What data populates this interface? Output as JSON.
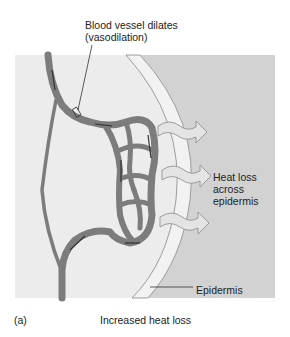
{
  "figure": {
    "panel_label": "(a)",
    "caption": "Increased heat loss",
    "labels": {
      "vessel_line1": "Blood vessel dilates",
      "vessel_line2": "(vasodilation)",
      "heat_line1": "Heat loss",
      "heat_line2": "across",
      "heat_line3": "epidermis",
      "epidermis": "Epidermis"
    },
    "colors": {
      "dermis_bg": "#ececec",
      "outside_bg": "#d2d2d2",
      "epidermis_band": "#efefef",
      "vessel": "#7c7c7c",
      "vessel_arrow": "#333333",
      "heat_arrow_fill": "#e2e2e2",
      "heat_arrow_stroke": "#8a8a8a"
    },
    "heat_arrow_count": 3
  }
}
